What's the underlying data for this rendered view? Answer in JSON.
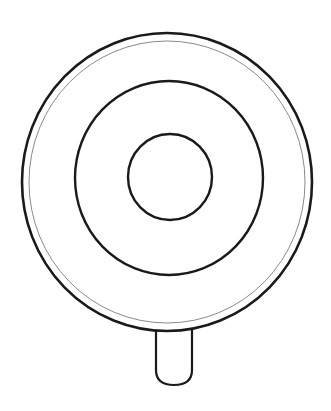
{
  "illustration": {
    "subject": "lollipop-line-drawing",
    "background_color": "#ffffff",
    "stroke_color": "#1a1a1a",
    "thin_stroke_color": "#8a8a8a",
    "outer_rim": {
      "cx": 167,
      "cy": 182,
      "rx": 145,
      "ry": 149
    },
    "inner_rim": {
      "cx": 167,
      "cy": 182,
      "rx": 138,
      "ry": 141
    },
    "middle_ring": {
      "cx": 169,
      "cy": 178,
      "rx": 94,
      "ry": 97
    },
    "center_circle": {
      "cx": 170,
      "cy": 177,
      "rx": 42,
      "ry": 43
    },
    "stick": {
      "x": 156,
      "y": 330,
      "width": 36,
      "height": 55
    }
  }
}
